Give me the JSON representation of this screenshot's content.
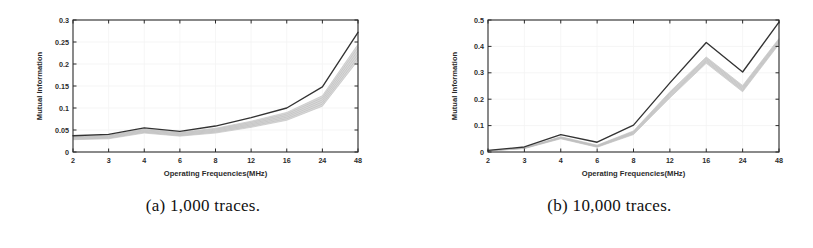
{
  "figure": {
    "panels": [
      {
        "id": "panel-a",
        "caption": "(a) 1,000 traces.",
        "chart_data": {
          "type": "line",
          "title": "",
          "xlabel": "Operating Frequencies(MHz)",
          "ylabel": "Mutual Information",
          "categories": [
            "2",
            "3",
            "4",
            "6",
            "8",
            "12",
            "16",
            "24",
            "48"
          ],
          "ytick_labels": [
            "0",
            "0.05",
            "0.1",
            "0.15",
            "0.2",
            "0.25",
            "0.3"
          ],
          "ytick_values": [
            0,
            0.05,
            0.1,
            0.15,
            0.2,
            0.25,
            0.3
          ],
          "ylim": [
            0,
            0.3
          ],
          "grid": true,
          "legend": "none",
          "series": [
            {
              "name": "maximum",
              "color": "#333333",
              "values": [
                0.037,
                0.04,
                0.055,
                0.047,
                0.059,
                0.078,
                0.1,
                0.148,
                0.272
              ]
            },
            {
              "name": "band-upper",
              "color": "#c9c9c9",
              "values": [
                0.036,
                0.038,
                0.052,
                0.045,
                0.054,
                0.07,
                0.09,
                0.128,
                0.245
              ]
            },
            {
              "name": "band-lower",
              "color": "#d8d8d8",
              "values": [
                0.028,
                0.03,
                0.043,
                0.036,
                0.043,
                0.056,
                0.072,
                0.104,
                0.208
              ]
            }
          ]
        }
      },
      {
        "id": "panel-b",
        "caption": "(b) 10,000 traces.",
        "chart_data": {
          "type": "line",
          "title": "",
          "xlabel": "Operating Frequencies(MHz)",
          "ylabel": "Mutual Information",
          "categories": [
            "2",
            "3",
            "4",
            "6",
            "8",
            "12",
            "16",
            "24",
            "48"
          ],
          "ytick_labels": [
            "0",
            "0.1",
            "0.2",
            "0.3",
            "0.4",
            "0.5"
          ],
          "ytick_values": [
            0,
            0.1,
            0.2,
            0.3,
            0.4,
            0.5
          ],
          "ylim": [
            0,
            0.5
          ],
          "grid": true,
          "legend": "none",
          "series": [
            {
              "name": "maximum",
              "color": "#333333",
              "values": [
                0.006,
                0.019,
                0.066,
                0.037,
                0.102,
                0.262,
                0.415,
                0.303,
                0.492
              ]
            },
            {
              "name": "band-upper",
              "color": "#c9c9c9",
              "values": [
                0.005,
                0.016,
                0.058,
                0.026,
                0.08,
                0.228,
                0.36,
                0.252,
                0.43
              ]
            },
            {
              "name": "band-lower",
              "color": "#d8d8d8",
              "values": [
                0.004,
                0.013,
                0.05,
                0.018,
                0.066,
                0.205,
                0.336,
                0.228,
                0.408
              ]
            }
          ]
        }
      }
    ]
  }
}
